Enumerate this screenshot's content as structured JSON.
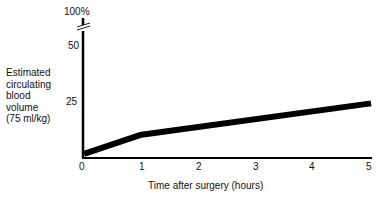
{
  "chart_data": {
    "type": "line",
    "title": "",
    "xlabel": "Time after surgery (hours)",
    "ylabel": "Estimated circulating blood volume (75 ml/kg)",
    "ylabel_lines": [
      "Estimated",
      "circulating",
      "blood",
      "volume",
      "(75 ml/kg)"
    ],
    "x_ticks": [
      "0",
      "1",
      "2",
      "3",
      "4",
      "5"
    ],
    "y_ticks": [
      "25",
      "50",
      "100%"
    ],
    "xlim": [
      0,
      5
    ],
    "ylim": [
      0,
      100
    ],
    "y_axis_break": "between 50 and 100%",
    "grid": false,
    "legend": null,
    "series": [
      {
        "name": "Estimated blood loss",
        "x": [
          0,
          1,
          5
        ],
        "values": [
          1,
          9.5,
          23.5
        ]
      }
    ]
  }
}
